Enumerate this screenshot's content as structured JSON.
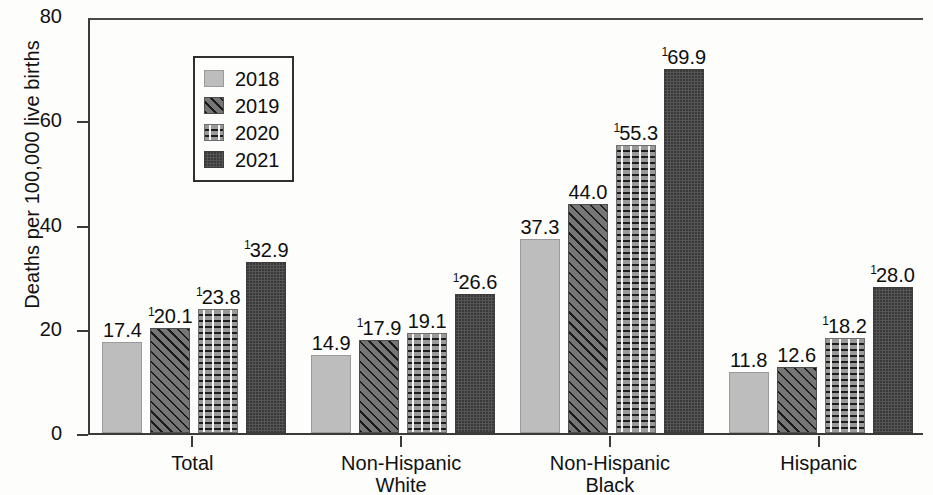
{
  "chart_data": {
    "type": "bar",
    "title": "",
    "subtitle": "",
    "xlabel": "",
    "ylabel": "Deaths per 100,000 live births",
    "ylim": [
      0,
      80
    ],
    "yticks": [
      0,
      20,
      40,
      60,
      80
    ],
    "grid": false,
    "legend_position": "top-left inside plot",
    "categories": [
      "Total",
      "Non-Hispanic White",
      "Non-Hispanic Black",
      "Hispanic"
    ],
    "category_lines": [
      [
        "Total"
      ],
      [
        "Non-Hispanic",
        "White"
      ],
      [
        "Non-Hispanic",
        "Black"
      ],
      [
        "Hispanic"
      ]
    ],
    "series": [
      {
        "name": "2018",
        "pattern": "light-stipple",
        "color": "#bdbdbd",
        "values": [
          17.4,
          14.9,
          37.3,
          11.8
        ],
        "labels": [
          "17.4",
          "14.9",
          "37.3",
          "11.8"
        ],
        "footnotes": [
          "",
          "",
          "",
          ""
        ]
      },
      {
        "name": "2019",
        "pattern": "diagonal-dotted",
        "color": "#767676",
        "values": [
          20.1,
          17.9,
          44.0,
          12.6
        ],
        "labels": [
          "20.1",
          "17.9",
          "44.0",
          "12.6"
        ],
        "footnotes": [
          "1",
          "1",
          "",
          ""
        ]
      },
      {
        "name": "2020",
        "pattern": "horizontal-dashes",
        "color": "#9a9a9a",
        "values": [
          23.8,
          19.1,
          55.3,
          18.2
        ],
        "labels": [
          "23.8",
          "19.1",
          "55.3",
          "18.2"
        ],
        "footnotes": [
          "1",
          "",
          "1",
          "1"
        ]
      },
      {
        "name": "2021",
        "pattern": "dark-solid",
        "color": "#555555",
        "values": [
          32.9,
          26.6,
          69.9,
          28.0
        ],
        "labels": [
          "32.9",
          "26.6",
          "69.9",
          "28.0"
        ],
        "footnotes": [
          "1",
          "1",
          "1",
          "1"
        ]
      }
    ]
  },
  "legend": {
    "items": [
      {
        "label": "2018"
      },
      {
        "label": "2019"
      },
      {
        "label": "2020"
      },
      {
        "label": "2021"
      }
    ]
  },
  "axis": {
    "y_title": "Deaths per 100,000 live births",
    "y_tick_labels": [
      "80",
      "60",
      "40",
      "20",
      "0"
    ]
  }
}
